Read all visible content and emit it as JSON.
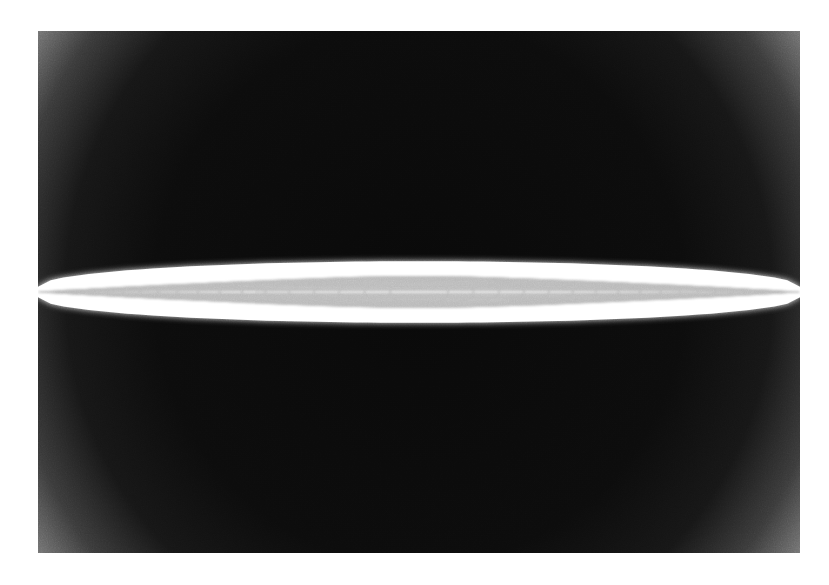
{
  "figure": {
    "kind": "scientific-render",
    "title": "",
    "caption": "",
    "plate": {
      "x": 38,
      "y": 31,
      "width": 762,
      "height": 522
    },
    "page": {
      "width": 829,
      "height": 585,
      "margin_color": "#ffffff"
    }
  },
  "colors": {
    "page_background": "#ffffff",
    "field_outer": "#9a9a9a",
    "field_mid": "#6e6e6e",
    "field_core": "#0b0b0b",
    "curve_stroke": "#ffffff",
    "curve_halo": "#f2f2f2",
    "grain_tint": "#808080"
  },
  "background_field": {
    "type": "radial-vignette",
    "center_x_pct": 50,
    "center_y_pct": 50,
    "radius_x_pct": 62,
    "radius_y_pct": 92,
    "stops": [
      {
        "offset_pct": 0,
        "color": "#090909"
      },
      {
        "offset_pct": 54,
        "color": "#0c0c0c"
      },
      {
        "offset_pct": 72,
        "color": "#161616"
      },
      {
        "offset_pct": 84,
        "color": "#3a3a3a"
      },
      {
        "offset_pct": 93,
        "color": "#707070"
      },
      {
        "offset_pct": 100,
        "color": "#969696"
      }
    ],
    "noise": {
      "enabled": true,
      "base_frequency": 0.85,
      "octaves": 4,
      "opacity": 0.55
    }
  },
  "chart_data": {
    "type": "line",
    "xlabel": "",
    "ylabel": "",
    "xlim": [
      -1.0,
      1.0
    ],
    "ylim": [
      -1.0,
      1.0
    ],
    "grid": false,
    "legend_position": "none",
    "annotations": [],
    "series_description": "Each series is one closed ellipse x^2/a^2 + y^2/b^2 = 1, all sharing the centre of the plate. Semi-axis a (horizontal, fraction of plate half-width) shrinks while semi-axis b (vertical, fraction of plate half-height) grows, producing the lens-shaped envelope band.",
    "center": {
      "x_pct": 50,
      "y_pct": 50
    },
    "stroke_width_px": 1.6,
    "stroke_color": "#ffffff",
    "ellipses": [
      {
        "index": 1,
        "a_pct": 100.0,
        "b_pct": 0.6
      },
      {
        "index": 2,
        "a_pct": 99.2,
        "b_pct": 1.1
      },
      {
        "index": 3,
        "a_pct": 98.0,
        "b_pct": 1.6
      },
      {
        "index": 4,
        "a_pct": 96.4,
        "b_pct": 2.1
      },
      {
        "index": 5,
        "a_pct": 94.3,
        "b_pct": 2.6
      },
      {
        "index": 6,
        "a_pct": 91.8,
        "b_pct": 3.1
      },
      {
        "index": 7,
        "a_pct": 88.9,
        "b_pct": 3.5
      },
      {
        "index": 8,
        "a_pct": 85.6,
        "b_pct": 3.9
      },
      {
        "index": 9,
        "a_pct": 81.9,
        "b_pct": 4.3
      },
      {
        "index": 10,
        "a_pct": 77.8,
        "b_pct": 4.6
      },
      {
        "index": 11,
        "a_pct": 73.4,
        "b_pct": 4.9
      },
      {
        "index": 12,
        "a_pct": 68.6,
        "b_pct": 5.2
      },
      {
        "index": 13,
        "a_pct": 63.5,
        "b_pct": 5.4
      },
      {
        "index": 14,
        "a_pct": 58.1,
        "b_pct": 5.6
      },
      {
        "index": 15,
        "a_pct": 52.4,
        "b_pct": 5.7
      },
      {
        "index": 16,
        "a_pct": 46.5,
        "b_pct": 5.8
      },
      {
        "index": 17,
        "a_pct": 40.4,
        "b_pct": 5.85
      },
      {
        "index": 18,
        "a_pct": 34.1,
        "b_pct": 5.85
      },
      {
        "index": 19,
        "a_pct": 27.6,
        "b_pct": 5.8
      },
      {
        "index": 20,
        "a_pct": 21.0,
        "b_pct": 5.7
      },
      {
        "index": 21,
        "a_pct": 14.3,
        "b_pct": 5.5
      },
      {
        "index": 22,
        "a_pct": 7.6,
        "b_pct": 5.2
      }
    ],
    "mirrored": true,
    "mirror_axis": "vertical",
    "envelope": {
      "description": "Bright lens band spanning the full plate width, maximum half-height at the centre",
      "half_height_center_pct": 5.9,
      "half_height_edge_pct": 1.0
    }
  }
}
